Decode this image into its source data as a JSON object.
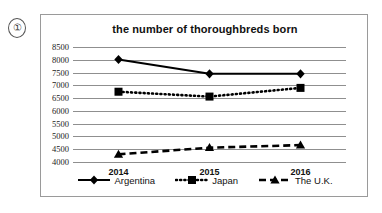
{
  "item_number": "①",
  "chart_data": {
    "type": "line",
    "title": "the number of thoroughbreds born",
    "xlabel": "",
    "ylabel": "",
    "categories": [
      "2014",
      "2015",
      "2016"
    ],
    "ylim": [
      4000,
      8500
    ],
    "ytick_step": 500,
    "yticks": [
      "8500",
      "8000",
      "7500",
      "7000",
      "6500",
      "6000",
      "5500",
      "5000",
      "4500",
      "4000"
    ],
    "grid": true,
    "legend_position": "bottom",
    "series": [
      {
        "name": "Argentina",
        "values": [
          8010,
          7450,
          7450
        ],
        "line_style": "solid",
        "marker": "diamond",
        "color": "#000000"
      },
      {
        "name": "Japan",
        "values": [
          6750,
          6560,
          6900
        ],
        "line_style": "dotted",
        "marker": "square",
        "color": "#000000"
      },
      {
        "name": "The U.K.",
        "values": [
          4300,
          4560,
          4660
        ],
        "line_style": "dashed",
        "marker": "triangle",
        "color": "#000000"
      }
    ]
  }
}
